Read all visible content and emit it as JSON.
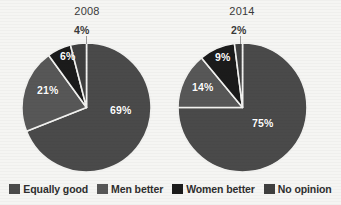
{
  "figure": {
    "title_remnant": "",
    "background_color": "#f5f5f3"
  },
  "colors": {
    "equally_good": "#4a4a4a",
    "men_better": "#575757",
    "women_better": "#1b1b1b",
    "no_opinion": "#3f3f3f",
    "separator": "#f2f2f0",
    "label_light": "#ffffff",
    "label_dark": "#3a3a3a"
  },
  "legend": {
    "items": [
      {
        "label": "Equally good",
        "color": "#4a4a4a",
        "key": "equally_good"
      },
      {
        "label": "Men better",
        "color": "#575757",
        "key": "men_better"
      },
      {
        "label": "Women better",
        "color": "#1b1b1b",
        "key": "women_better"
      },
      {
        "label": "No opinion",
        "color": "#3f3f3f",
        "key": "no_opinion"
      }
    ]
  },
  "charts": [
    {
      "year": "2008",
      "labels": {
        "equally_good": "69%",
        "men_better": "21%",
        "women_better": "6%",
        "no_opinion": "4%"
      }
    },
    {
      "year": "2014",
      "labels": {
        "equally_good": "75%",
        "men_better": "14%",
        "women_better": "9%",
        "no_opinion": "2%"
      }
    }
  ],
  "chart_data": [
    {
      "type": "pie",
      "title": "2008",
      "categories": [
        "Equally good",
        "Men better",
        "Women better",
        "No opinion"
      ],
      "values": [
        69,
        21,
        6,
        4
      ],
      "value_labels": [
        "69%",
        "21%",
        "6%",
        "4%"
      ],
      "unit": "percent",
      "start_angle_deg": 0,
      "direction": "clockwise",
      "colors": [
        "#4a4a4a",
        "#575757",
        "#1b1b1b",
        "#3f3f3f"
      ],
      "legend_position": "bottom",
      "grid": false
    },
    {
      "type": "pie",
      "title": "2014",
      "categories": [
        "Equally good",
        "Men better",
        "Women better",
        "No opinion"
      ],
      "values": [
        75,
        14,
        9,
        2
      ],
      "value_labels": [
        "75%",
        "14%",
        "9%",
        "2%"
      ],
      "unit": "percent",
      "start_angle_deg": 0,
      "direction": "clockwise",
      "colors": [
        "#4a4a4a",
        "#575757",
        "#1b1b1b",
        "#3f3f3f"
      ],
      "legend_position": "bottom",
      "grid": false
    }
  ]
}
